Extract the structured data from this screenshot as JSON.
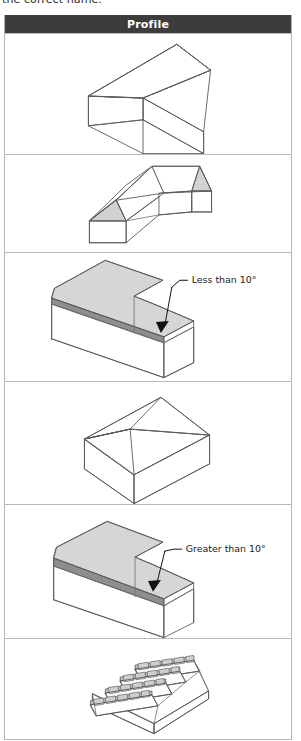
{
  "caption": {
    "text": "the correct name."
  },
  "table": {
    "header": "Profile",
    "header_bg": "#3c3c3c",
    "header_fg": "#ffffff",
    "border_color": "#b9b9b9",
    "roof_fill": "#d2d2d2",
    "fascia_fill": "#8e8e8e",
    "line_color": "#5a5a5a",
    "rows": [
      {
        "id": "row-1",
        "profile": "gable-roof",
        "shaded": false,
        "annotation": ""
      },
      {
        "id": "row-2",
        "profile": "l-shaped-hipped-roof",
        "shaded": true,
        "annotation": ""
      },
      {
        "id": "row-3",
        "profile": "flat-roof",
        "shaded": true,
        "annotation": "Less than 10°"
      },
      {
        "id": "row-4",
        "profile": "hipped-roof",
        "shaded": false,
        "annotation": ""
      },
      {
        "id": "row-5",
        "profile": "mono-pitch-roof",
        "shaded": true,
        "annotation": "Greater than 10°"
      },
      {
        "id": "row-6",
        "profile": "sawtooth-north-light-roof",
        "shaded": true,
        "annotation": "",
        "glazing_bays": 4,
        "panes_per_bay": 5
      }
    ]
  }
}
